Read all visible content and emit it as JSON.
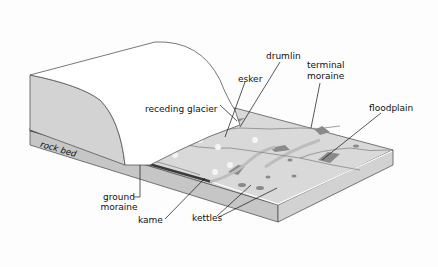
{
  "diagram": {
    "type": "glacial landform block diagram",
    "labels": {
      "receding_glacier": "receding glacier",
      "drumlin": "drumlin",
      "esker": "esker",
      "terminal_moraine_1": "terminal",
      "terminal_moraine_2": "moraine",
      "floodplain": "floodplain",
      "rock_bed": "rock bed",
      "ground_moraine_1": "ground",
      "ground_moraine_2": "moraine",
      "kame": "kame",
      "kettles": "kettles"
    },
    "colors": {
      "glacier_top": "#ffffff",
      "glacier_side": "#d4d4d4",
      "slab_top": "#d8d8d8",
      "slab_front": "#c4c4c4",
      "slab_side": "#cfcfcf",
      "ground_moraine": "#3a3a3a",
      "deposit": "#8a8a8a",
      "outline": "#555555"
    }
  }
}
